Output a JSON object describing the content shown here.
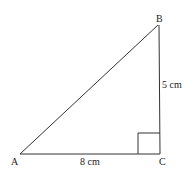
{
  "diagram": {
    "type": "right-triangle",
    "vertices": {
      "A": {
        "label": "A",
        "x": 20,
        "y": 154
      },
      "B": {
        "label": "B",
        "x": 158,
        "y": 25
      },
      "C": {
        "label": "C",
        "x": 160,
        "y": 154
      }
    },
    "sides": {
      "AC": {
        "label": "8 cm"
      },
      "BC": {
        "label": "5 cm"
      }
    },
    "right_angle_at": "C",
    "stroke_color": "#333333"
  }
}
